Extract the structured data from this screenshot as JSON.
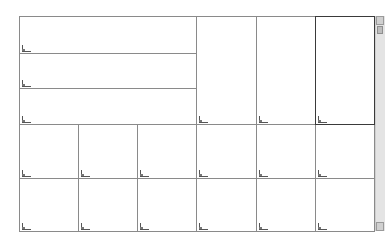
{
  "app": {
    "type": "cad-multi-viewport-layout"
  },
  "colors": {
    "background": "#ffffff",
    "viewport_border": "#8a8a8a",
    "active_viewport_border": "#3a3a3a",
    "scrollbar": "#e4e4e4"
  },
  "viewports": [
    {
      "id": "vp-top-wide-1",
      "x": 19,
      "y": 16,
      "w": 178,
      "h": 38,
      "active": false,
      "ucs_icon": "ucs-icon"
    },
    {
      "id": "vp-top-wide-2",
      "x": 19,
      "y": 53,
      "w": 178,
      "h": 36,
      "active": false,
      "ucs_icon": "ucs-icon"
    },
    {
      "id": "vp-top-wide-3",
      "x": 19,
      "y": 88,
      "w": 178,
      "h": 37,
      "active": false,
      "ucs_icon": "ucs-icon"
    },
    {
      "id": "vp-top-tall-1",
      "x": 196,
      "y": 16,
      "w": 61,
      "h": 109,
      "active": false,
      "ucs_icon": "ucs-icon"
    },
    {
      "id": "vp-top-tall-2",
      "x": 256,
      "y": 16,
      "w": 60,
      "h": 109,
      "active": false,
      "ucs_icon": "ucs-icon"
    },
    {
      "id": "vp-top-tall-3",
      "x": 315,
      "y": 16,
      "w": 60,
      "h": 109,
      "active": true,
      "ucs_icon": "ucs-icon"
    },
    {
      "id": "vp-mid-1",
      "x": 19,
      "y": 124,
      "w": 60,
      "h": 55,
      "active": false,
      "ucs_icon": "ucs-icon"
    },
    {
      "id": "vp-mid-2",
      "x": 78,
      "y": 124,
      "w": 60,
      "h": 55,
      "active": false,
      "ucs_icon": "ucs-icon"
    },
    {
      "id": "vp-mid-3",
      "x": 137,
      "y": 124,
      "w": 60,
      "h": 55,
      "active": false,
      "ucs_icon": "ucs-icon"
    },
    {
      "id": "vp-mid-4",
      "x": 196,
      "y": 124,
      "w": 61,
      "h": 55,
      "active": false,
      "ucs_icon": "ucs-icon"
    },
    {
      "id": "vp-mid-5",
      "x": 256,
      "y": 124,
      "w": 60,
      "h": 55,
      "active": false,
      "ucs_icon": "ucs-icon"
    },
    {
      "id": "vp-mid-6",
      "x": 315,
      "y": 124,
      "w": 60,
      "h": 55,
      "active": false,
      "ucs_icon": "ucs-icon"
    },
    {
      "id": "vp-bot-1",
      "x": 19,
      "y": 178,
      "w": 60,
      "h": 54,
      "active": false,
      "ucs_icon": "ucs-icon"
    },
    {
      "id": "vp-bot-2",
      "x": 78,
      "y": 178,
      "w": 60,
      "h": 54,
      "active": false,
      "ucs_icon": "ucs-icon"
    },
    {
      "id": "vp-bot-3",
      "x": 137,
      "y": 178,
      "w": 60,
      "h": 54,
      "active": false,
      "ucs_icon": "ucs-icon"
    },
    {
      "id": "vp-bot-4",
      "x": 196,
      "y": 178,
      "w": 61,
      "h": 54,
      "active": false,
      "ucs_icon": "ucs-icon"
    },
    {
      "id": "vp-bot-5",
      "x": 256,
      "y": 178,
      "w": 60,
      "h": 54,
      "active": false,
      "ucs_icon": "ucs-icon"
    },
    {
      "id": "vp-bot-6",
      "x": 315,
      "y": 178,
      "w": 60,
      "h": 54,
      "active": false,
      "ucs_icon": "ucs-icon"
    }
  ],
  "scrollbar": {
    "orientation": "vertical"
  }
}
